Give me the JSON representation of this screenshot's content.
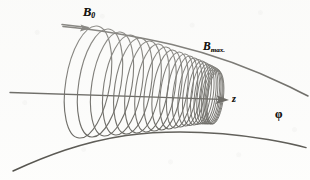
{
  "figure": {
    "kind": "hand-drawn physics diagram",
    "background_color": "#fdfdfc",
    "ink_color": "#15130f"
  },
  "labels": {
    "b0": {
      "symbol": "B",
      "subscript": "0",
      "name": "initial-field-strength"
    },
    "bmax": {
      "symbol": "B",
      "subscript": "max.",
      "name": "maximum-field-strength"
    },
    "z": {
      "symbol": "z",
      "name": "axial-coordinate"
    },
    "phi": {
      "symbol": "φ",
      "name": "azimuthal-coordinate"
    }
  },
  "chart_data": {
    "type": "line",
    "xlabel": "z",
    "ylabel": "φ",
    "grid": false,
    "legend": null,
    "annotations": [
      {
        "text": "B0",
        "x": 88,
        "y": 12,
        "role": "field-label-weak-end"
      },
      {
        "text": "Bmax.",
        "x": 210,
        "y": 47,
        "role": "field-label-strong-end"
      },
      {
        "text": "z",
        "x": 236,
        "y": 100,
        "role": "axis-label"
      },
      {
        "text": "φ",
        "x": 279,
        "y": 114,
        "role": "axis-label"
      }
    ],
    "series": [
      {
        "name": "magnetic-axis",
        "kind": "straight-arrow",
        "x": [
          10,
          228
        ],
        "y": [
          93,
          100
        ]
      },
      {
        "name": "upper-field-line",
        "kind": "arrow-curve",
        "comment": "B0 flux line converging to Bmax, arrow at upper-left tail",
        "points": [
          [
            62,
            27
          ],
          [
            100,
            31
          ],
          [
            150,
            40
          ],
          [
            200,
            52
          ],
          [
            250,
            70
          ],
          [
            300,
            92
          ]
        ]
      },
      {
        "name": "lower-field-line",
        "kind": "curve",
        "comment": "mirror-image flux line below the axis",
        "points": [
          [
            14,
            170
          ],
          [
            60,
            150
          ],
          [
            110,
            138
          ],
          [
            165,
            133
          ],
          [
            220,
            134
          ],
          [
            270,
            140
          ],
          [
            305,
            148
          ]
        ]
      },
      {
        "name": "helix-loops",
        "kind": "helix-turns",
        "comment": "gyration loops: radius shrinks and pitch compresses toward increasing B",
        "turn_count": 24,
        "loop_centers_x": [
          88,
          100,
          112,
          123,
          133,
          143,
          152,
          160,
          167,
          174,
          180,
          185,
          190,
          194,
          198,
          201,
          204,
          206.5,
          208.5,
          210.5,
          212,
          213.5,
          214.5,
          215.5
        ],
        "loop_center_y": [
          82,
          83,
          84,
          85,
          86,
          87,
          88,
          89,
          90,
          90.5,
          91,
          91.5,
          92,
          92.5,
          93,
          93.5,
          94,
          94.5,
          95,
          95.5,
          96,
          96.5,
          97,
          97.5
        ],
        "loop_radius_y": [
          56,
          54,
          52,
          50,
          48,
          46,
          44,
          42,
          40,
          38.5,
          37,
          35.5,
          34,
          33,
          32,
          31,
          30,
          29.5,
          29,
          28.5,
          28,
          27.5,
          27,
          26.5
        ],
        "loop_radius_x": [
          22,
          21,
          20,
          19,
          18,
          17,
          16,
          15,
          14,
          13.2,
          12.5,
          11.8,
          11.2,
          10.6,
          10.1,
          9.7,
          9.3,
          9.0,
          8.7,
          8.5,
          8.3,
          8.1,
          8.0,
          7.9
        ]
      }
    ],
    "xlim": [
      0,
      310
    ],
    "ylim": [
      180,
      0
    ]
  }
}
